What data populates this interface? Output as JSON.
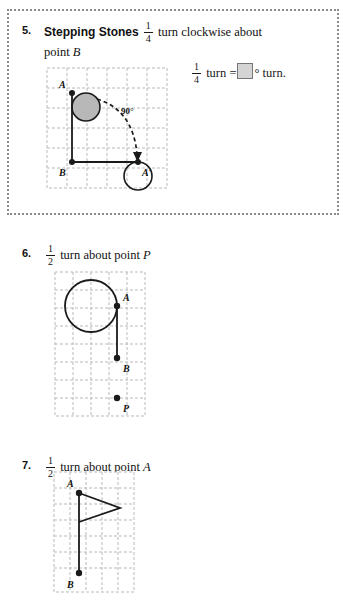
{
  "page": {
    "background": "#ffffff",
    "width": 343,
    "height": 609,
    "ink_color": "#1a1a1a"
  },
  "problems": [
    {
      "number": "5.",
      "callout": true,
      "callout_border_color": "#8a8a8a",
      "label": "Stepping Stones",
      "stem_fraction": {
        "numerator": "1",
        "denominator": "4"
      },
      "stem_text_after": " turn clockwise about",
      "stem_line2": "point ",
      "stem_line2_point": "B",
      "answer_line": {
        "fraction": {
          "numerator": "1",
          "denominator": "4"
        },
        "text_before": " turn =",
        "box_fill": "#d4d4d4",
        "box_stroke": "#767676",
        "text_after": "° turn."
      },
      "figure": {
        "type": "grid-diagram",
        "grid_cols": 6,
        "grid_cells_down": 6,
        "cell_size": 20,
        "grid_color": "#b9b9b9",
        "points": [
          {
            "name": "A",
            "label": "A",
            "x": 27,
            "y": 27
          },
          {
            "name": "B",
            "label": "B",
            "x": 27,
            "y": 96
          },
          {
            "name": "A-prime",
            "label": "A′",
            "x": 93,
            "y": 96
          }
        ],
        "shaded_circle": {
          "cx": 41,
          "cy": 41,
          "r": 14,
          "fill": "#b8b8b8",
          "stroke": "#1a1a1a"
        },
        "open_circle": {
          "cx": 93,
          "cy": 110,
          "r": 14,
          "fill": "none",
          "stroke": "#1a1a1a"
        },
        "angle_label": "90°",
        "has_dashed_arrow": true
      }
    },
    {
      "number": "6.",
      "callout": false,
      "stem_fraction": {
        "numerator": "1",
        "denominator": "2"
      },
      "stem_text_after": " turn about point ",
      "stem_point": "P",
      "figure": {
        "type": "grid-diagram",
        "grid_cols": 5,
        "grid_cells_down": 8,
        "cell_size": 18,
        "grid_color": "#b9b9b9",
        "points": [
          {
            "name": "A",
            "label": "A",
            "x": 67,
            "y": 38
          },
          {
            "name": "B",
            "label": "B",
            "x": 67,
            "y": 90
          },
          {
            "name": "P",
            "label": "P",
            "x": 67,
            "y": 130
          }
        ],
        "open_circle": {
          "cx": 41,
          "cy": 38,
          "r": 26,
          "fill": "none",
          "stroke": "#1a1a1a"
        }
      }
    },
    {
      "number": "7.",
      "callout": false,
      "stem_fraction": {
        "numerator": "1",
        "denominator": "2"
      },
      "stem_text_after": " turn about point ",
      "stem_point": "A",
      "figure": {
        "type": "grid-diagram",
        "grid_cols": 5,
        "grid_cells_down": 7,
        "cell_size": 16,
        "grid_color": "#b9b9b9",
        "points": [
          {
            "name": "A",
            "label": "A",
            "x": 29,
            "y": 25
          },
          {
            "name": "B",
            "label": "B",
            "x": 29,
            "y": 105
          }
        ],
        "flag": {
          "apex_x": 70,
          "apex_y": 40,
          "bottom_x": 29,
          "bottom_y": 54
        }
      }
    }
  ]
}
